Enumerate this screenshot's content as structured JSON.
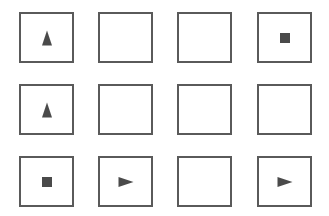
{
  "grid": {
    "rows": 3,
    "cols": 4,
    "cells": [
      {
        "row": 0,
        "col": 0,
        "symbol": "triangle-up"
      },
      {
        "row": 0,
        "col": 1,
        "symbol": "empty"
      },
      {
        "row": 0,
        "col": 2,
        "symbol": "empty"
      },
      {
        "row": 0,
        "col": 3,
        "symbol": "square"
      },
      {
        "row": 1,
        "col": 0,
        "symbol": "triangle-up"
      },
      {
        "row": 1,
        "col": 1,
        "symbol": "empty"
      },
      {
        "row": 1,
        "col": 2,
        "symbol": "empty"
      },
      {
        "row": 1,
        "col": 3,
        "symbol": "empty"
      },
      {
        "row": 2,
        "col": 0,
        "symbol": "square"
      },
      {
        "row": 2,
        "col": 1,
        "symbol": "triangle-right"
      },
      {
        "row": 2,
        "col": 2,
        "symbol": "empty"
      },
      {
        "row": 2,
        "col": 3,
        "symbol": "triangle-right"
      }
    ]
  },
  "colors": {
    "border": "#5a5a5a",
    "symbol": "#4a4a4a",
    "background": "#ffffff"
  }
}
